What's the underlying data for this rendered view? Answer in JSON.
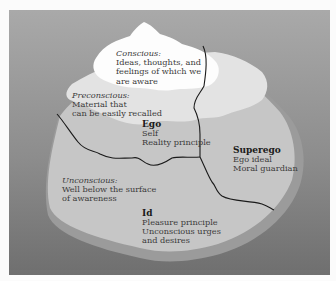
{
  "colors": {
    "water_top": "#a9a9a9",
    "water_bottom": "#6f6f6f",
    "conscious": "#fdfdfd",
    "preconscious": "#e3e3e3",
    "unconscious": "#c6c6c6",
    "underwater_edge": "#9b9b9b",
    "boundary_line": "#1a1a1a"
  },
  "levels": {
    "conscious": {
      "heading": "Conscious:",
      "lines": [
        "Ideas, thoughts, and",
        "feelings of which we",
        "are aware"
      ]
    },
    "preconscious": {
      "heading": "Preconscious:",
      "lines": [
        "Material that",
        "can be easily recalled"
      ]
    },
    "unconscious": {
      "heading": "Unconscious:",
      "lines": [
        "Well below the surface",
        "of awareness"
      ]
    }
  },
  "structures": {
    "ego": {
      "heading": "Ego",
      "lines": [
        "Self",
        "Reality principle"
      ]
    },
    "superego": {
      "heading": "Superego",
      "lines": [
        "Ego ideal",
        "Moral guardian"
      ]
    },
    "id": {
      "heading": "Id",
      "lines": [
        "Pleasure principle",
        "Unconscious urges",
        "and desires"
      ]
    }
  }
}
